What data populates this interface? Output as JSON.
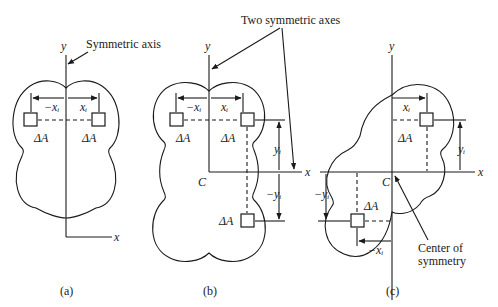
{
  "figure": {
    "panels": [
      {
        "id": "a",
        "caption": "(a)",
        "axis_x": "x",
        "axis_y": "y",
        "annotation": "Symmetric axis",
        "labels": {
          "neg_x": "−xᵢ",
          "pos_x": "xᵢ",
          "area_left": "ΔA",
          "area_right": "ΔA"
        }
      },
      {
        "id": "b",
        "caption": "(b)",
        "axis_x": "x",
        "axis_y": "y",
        "annotation": "Two symmetric axes",
        "center": "C",
        "labels": {
          "neg_x": "−xᵢ",
          "pos_x": "xᵢ",
          "pos_y": "yᵢ",
          "neg_y": "−yᵢ",
          "area_top_left": "ΔA",
          "area_top_right": "ΔA",
          "area_bottom": "ΔA"
        }
      },
      {
        "id": "c",
        "caption": "(c)",
        "axis_x": "x",
        "axis_y": "y",
        "annotation": "Center of symmetry",
        "annotation_line1": "Center of",
        "annotation_line2": "symmetry",
        "center": "C",
        "labels": {
          "pos_x": "xᵢ",
          "neg_x": "−xᵢ",
          "pos_y": "yᵢ",
          "neg_y": "−yᵢ",
          "area_top": "ΔA",
          "area_bottom": "ΔA"
        }
      }
    ]
  }
}
